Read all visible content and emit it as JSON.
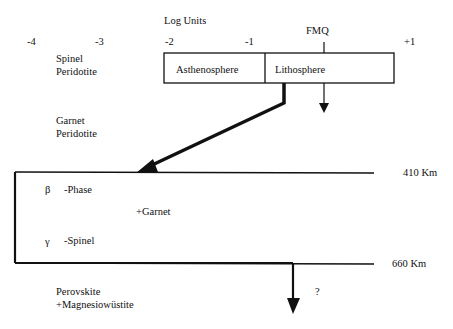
{
  "axis": {
    "title": "Log Units",
    "ticks": [
      "-4",
      "-3",
      "-2",
      "-1",
      "+1"
    ],
    "fmq_label": "FMQ"
  },
  "box": {
    "left_label": "Asthenosphere",
    "right_label": "Lithosphere"
  },
  "zones": {
    "spinel_1": "Spinel",
    "spinel_2": "Peridotite",
    "garnet_1": "Garnet",
    "garnet_2": "Peridotite",
    "beta_symbol": "β",
    "beta_label": "-Phase",
    "plus_garnet": "+Garnet",
    "gamma_symbol": "γ",
    "gamma_label": "-Spinel",
    "perov_1": "Perovskite",
    "perov_2": "+Magnesiowüstite"
  },
  "depths": {
    "d410": "410 Km",
    "d660": "660 Km"
  },
  "question_mark": "?"
}
